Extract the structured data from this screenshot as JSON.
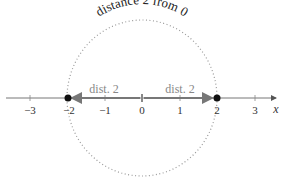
{
  "title": "distance 2 from 0",
  "axis": {
    "variable": "x",
    "ticks": [
      {
        "value": -3,
        "label": "−3"
      },
      {
        "value": -2,
        "label": "−2"
      },
      {
        "value": -1,
        "label": "−1"
      },
      {
        "value": 0,
        "label": "0"
      },
      {
        "value": 1,
        "label": "1"
      },
      {
        "value": 2,
        "label": "2"
      },
      {
        "value": 3,
        "label": "3"
      }
    ]
  },
  "segments": {
    "left_label": "dist. 2",
    "right_label": "dist. 2"
  },
  "points": [
    {
      "value": -2,
      "label": "-2"
    },
    {
      "value": 2,
      "label": "2"
    }
  ],
  "colors": {
    "axis": "#555555",
    "segment": "#888888",
    "circle": "#999999",
    "point": "#111111"
  }
}
